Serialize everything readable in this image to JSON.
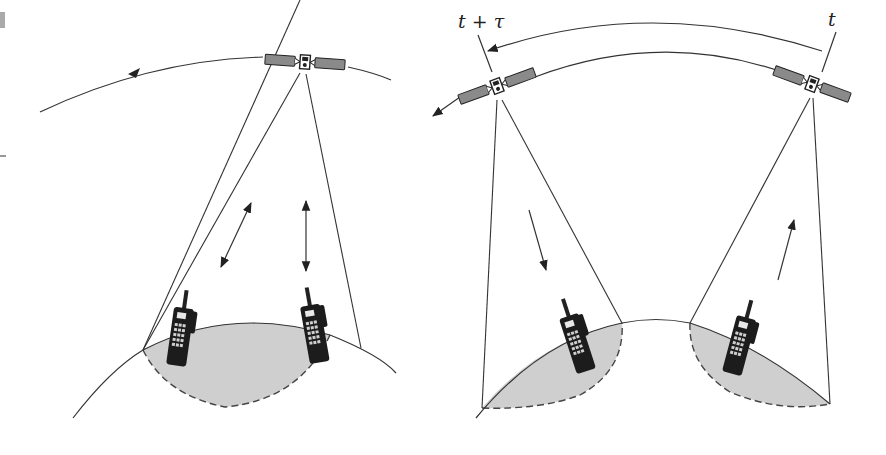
{
  "figure": {
    "type": "satellite coverage illustration",
    "panels": [
      {
        "id": "left",
        "description": "Single satellite with one footprint; two handsets with bidirectional links",
        "satellites": 1,
        "handsets": 2,
        "link_arrows": [
          "bidirectional-diagonal",
          "bidirectional-vertical"
        ],
        "orbit_direction": "right-to-left"
      },
      {
        "id": "right",
        "description": "Satellite at time t and later at t+tau; uplink on right footprint, downlink on left footprint",
        "satellites": 2,
        "handsets": 2,
        "time_labels": {
          "start": "t",
          "end": "t + τ"
        },
        "link_arrows": [
          "downlink",
          "uplink"
        ],
        "orbit_direction": "right-to-left"
      }
    ],
    "colors": {
      "line": "#333333",
      "footprint": "#cfcfcf",
      "panel": "#8a8a8a",
      "handset": "#1c1c1c",
      "background": "#ffffff"
    }
  }
}
